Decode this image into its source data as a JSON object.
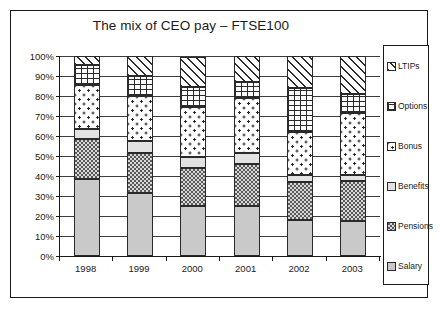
{
  "chart_data": {
    "type": "bar",
    "subtype": "stacked-100-percent",
    "title": "The mix of CEO pay – FTSE100",
    "xlabel": "",
    "ylabel": "",
    "ylim": [
      0,
      100
    ],
    "ytick_labels": [
      "0%",
      "10%",
      "20%",
      "30%",
      "40%",
      "50%",
      "60%",
      "70%",
      "80%",
      "90%",
      "100%"
    ],
    "ytick_values": [
      0,
      10,
      20,
      30,
      40,
      50,
      60,
      70,
      80,
      90,
      100
    ],
    "grid": true,
    "legend_position": "right",
    "categories": [
      "1998",
      "1999",
      "2000",
      "2001",
      "2002",
      "2003"
    ],
    "series": [
      {
        "name": "Salary",
        "values": [
          38.5,
          31.5,
          25.0,
          25.0,
          18.0,
          17.5
        ],
        "fill": "fill-salary"
      },
      {
        "name": "Pensions",
        "values": [
          20.0,
          20.0,
          19.0,
          21.0,
          19.0,
          20.0
        ],
        "fill": "fill-pensions"
      },
      {
        "name": "Benefits",
        "values": [
          5.0,
          6.0,
          5.5,
          5.5,
          3.5,
          3.0
        ],
        "fill": "fill-benefits"
      },
      {
        "name": "Bonus",
        "values": [
          22.0,
          22.5,
          25.0,
          27.5,
          21.5,
          31.0
        ],
        "fill": "fill-bonus"
      },
      {
        "name": "Options",
        "values": [
          10.0,
          10.0,
          10.0,
          8.0,
          22.0,
          9.5
        ],
        "fill": "fill-options"
      },
      {
        "name": "LTIPs",
        "values": [
          4.5,
          10.0,
          15.0,
          13.0,
          16.0,
          19.0
        ],
        "fill": "fill-ltips"
      }
    ]
  },
  "legend": {
    "items": [
      {
        "label": "LTIPs",
        "fill": "fill-ltips"
      },
      {
        "label": "Options",
        "fill": "fill-options"
      },
      {
        "label": "Bonus",
        "fill": "fill-bonus"
      },
      {
        "label": "Benefits",
        "fill": "fill-benefits"
      },
      {
        "label": "Pensions",
        "fill": "fill-pensions"
      },
      {
        "label": "Salary",
        "fill": "fill-salary"
      }
    ]
  },
  "colors": {
    "frame": "#1a1a1a",
    "grid": "#3c3c3c",
    "text": "#1a1a1a",
    "background": "#ffffff"
  }
}
